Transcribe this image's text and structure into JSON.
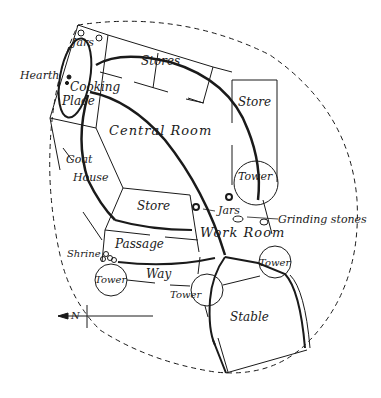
{
  "diagram": {
    "type": "site-plan",
    "labels": {
      "jars_top": "Jars",
      "hearth": "Hearth",
      "cooking_place_1": "Cooking",
      "cooking_place_2": "Place",
      "stores": "Stores",
      "store_ne": "Store",
      "central_room": "Central Room",
      "goat_house_1": "Goat",
      "goat_house_2": "House",
      "tower_east": "Tower",
      "store_center": "Store",
      "jars_center": "Jars",
      "grinding_stones": "Grinding stones",
      "work_room": "Work Room",
      "passage": "Passage",
      "shrine": "Shrine",
      "tower_sw": "Tower",
      "way": "Way",
      "tower_s": "Tower",
      "tower_se": "Tower",
      "stable": "Stable",
      "north_marker": "N"
    },
    "colors": {
      "ink": "#1a1a1a",
      "background": "#ffffff"
    }
  }
}
